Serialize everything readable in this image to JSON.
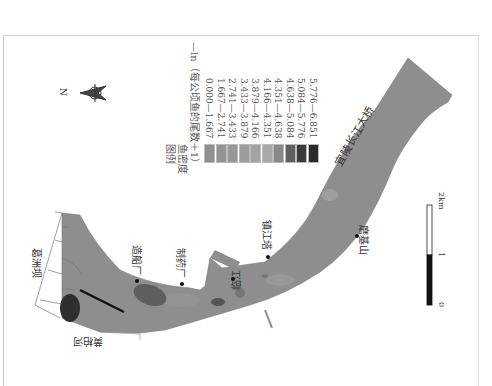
{
  "figure": {
    "type": "fish density distribution map",
    "orientation": "rotated 90 degrees clockwise"
  },
  "legend": {
    "title": "图例",
    "subtitle": "鱼密度",
    "unit": "—ln（每公顷鱼的尾数＋1）",
    "classes": [
      {
        "range": "0.000—1.667",
        "color": "#8f8f8f"
      },
      {
        "range": "1.667—2.741",
        "color": "#939393"
      },
      {
        "range": "2.741—3.433",
        "color": "#979797"
      },
      {
        "range": "3.433—3.879",
        "color": "#9c9c9c"
      },
      {
        "range": "3.879—4.166",
        "color": "#a3a3a3"
      },
      {
        "range": "4.166—4.351",
        "color": "#a9a9a9"
      },
      {
        "range": "4.351—4.638",
        "color": "#888888"
      },
      {
        "range": "4.638—5.084",
        "color": "#5e5e5e"
      },
      {
        "range": "5.084—5.776",
        "color": "#3a3a3a"
      },
      {
        "range": "5.776—6.851",
        "color": "#2a2a2a"
      }
    ]
  },
  "compass": {
    "label": "N"
  },
  "places": {
    "dam": "葛洲坝",
    "tributary": "黄柏河",
    "shipyard": "造船厂",
    "pharma": "制药厂",
    "port": "临江",
    "tower": "镇江塔",
    "mountain": "磨基山",
    "bridge": "宜陵长江大桥"
  },
  "scale_bar": {
    "ticks": [
      "0",
      "1",
      "2km"
    ]
  },
  "colors": {
    "river": "#8e8e8e",
    "bank_line": "#666666",
    "transect": "#111111"
  }
}
